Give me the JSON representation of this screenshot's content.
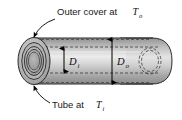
{
  "figure": {
    "type": "engineering-cross-section-diagram",
    "callouts": [
      {
        "id": "outer-cover",
        "text_main": "Outer cover at ",
        "symbol": "T",
        "subscript": "o",
        "position": "top",
        "points_to": "outer-cover-surface-top-left"
      },
      {
        "id": "inner-tube",
        "text_main": "Tube at ",
        "symbol": "T",
        "subscript": "i",
        "position": "bottom",
        "points_to": "inner-tube-surface-bottom-left"
      }
    ],
    "dimensions": [
      {
        "id": "inner-diameter",
        "symbol": "D",
        "subscript": "i",
        "orientation": "vertical",
        "measures": "inner tube diameter"
      },
      {
        "id": "outer-diameter",
        "symbol": "D",
        "subscript": "o",
        "orientation": "vertical",
        "measures": "outer cover diameter"
      }
    ],
    "colors": {
      "outline": "#2b2b2b",
      "hidden_line": "#3a3a3a",
      "body_light": "#e8e8e8",
      "body_mid": "#bdbdbd",
      "body_dark": "#8d8d8d",
      "end_face": "#a8a8a8",
      "background": "#ffffff",
      "text": "#1a1a1a"
    }
  }
}
